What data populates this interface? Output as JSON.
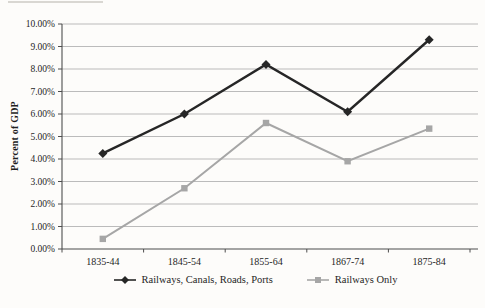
{
  "chart_data": {
    "type": "line",
    "categories": [
      "1835-44",
      "1845-54",
      "1855-64",
      "1867-74",
      "1875-84"
    ],
    "series": [
      {
        "name": "Railways, Canals, Roads, Ports",
        "values": [
          4.25,
          6.0,
          8.2,
          6.1,
          9.3
        ],
        "color": "#262626",
        "marker": "diamond"
      },
      {
        "name": "Railways Only",
        "values": [
          0.45,
          2.7,
          5.6,
          3.9,
          5.35
        ],
        "color": "#a6a6a6",
        "marker": "square"
      }
    ],
    "title": "",
    "xlabel": "",
    "ylabel": "Percent of GDP",
    "ylim": [
      0,
      10
    ],
    "ytick_step": 1,
    "ytick_labels": [
      "0.00%",
      "1.00%",
      "2.00%",
      "3.00%",
      "4.00%",
      "5.00%",
      "6.00%",
      "7.00%",
      "8.00%",
      "9.00%",
      "10.00%"
    ],
    "grid": "horizontal",
    "legend_position": "bottom"
  },
  "colors": {
    "background": "#fdfcfa",
    "gridline": "#b3b3b3",
    "axis": "#4d4d4d",
    "text": "#1f1f1f"
  }
}
